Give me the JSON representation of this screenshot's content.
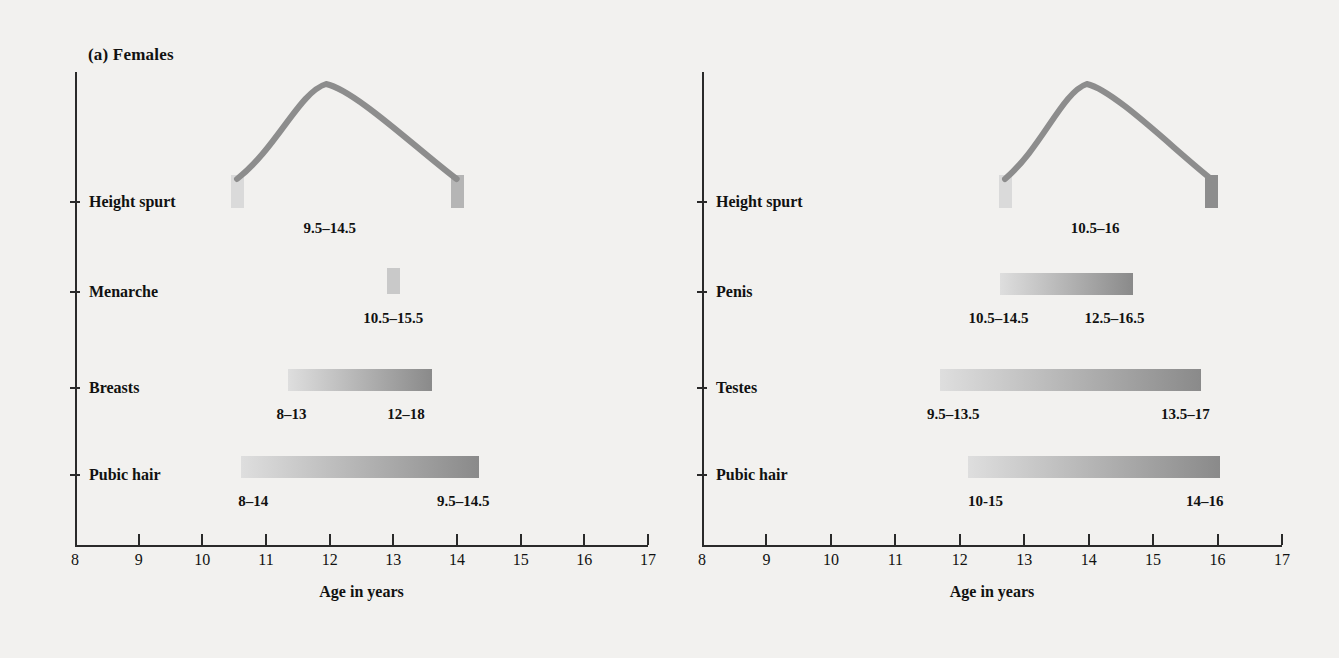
{
  "figure": {
    "background_color": "#f2f1ef",
    "axis_color": "#2a2a2a",
    "bar_light": "#dedede",
    "bar_dark": "#8a8a8a",
    "curve_color": "#8d8d8d"
  },
  "panels": [
    {
      "id": "females",
      "title": "(a) Females",
      "axis_caption": "Age in years",
      "x_ticks": [
        "8",
        "9",
        "10",
        "11",
        "12",
        "13",
        "14",
        "15",
        "16",
        "17"
      ],
      "rows": [
        {
          "label": "Height spurt",
          "type": "curve",
          "start": 10.55,
          "peak": 11.95,
          "end": 14.0,
          "labels": [
            {
              "text": "9.5–14.5",
              "at": 12.0
            }
          ]
        },
        {
          "label": "Menarche",
          "type": "block",
          "start": 12.9,
          "end": 13.1,
          "labels": [
            {
              "text": "10.5–15.5",
              "at": 13.0
            }
          ]
        },
        {
          "label": "Breasts",
          "type": "bar",
          "start": 11.35,
          "end": 13.6,
          "labels": [
            {
              "text": "8–13",
              "at": 11.4
            },
            {
              "text": "12–18",
              "at": 13.2
            }
          ]
        },
        {
          "label": "Pubic hair",
          "type": "bar",
          "start": 10.6,
          "end": 14.35,
          "labels": [
            {
              "text": "8–14",
              "at": 10.8
            },
            {
              "text": "9.5–14.5",
              "at": 14.1
            }
          ]
        }
      ]
    },
    {
      "id": "males",
      "title": "(b) Males",
      "axis_caption": "Age in years",
      "x_ticks": [
        "8",
        "9",
        "10",
        "11",
        "12",
        "13",
        "14",
        "15",
        "16",
        "17"
      ],
      "rows": [
        {
          "label": "Height spurt",
          "type": "curve",
          "start": 12.7,
          "peak": 13.97,
          "end": 15.9,
          "labels": [
            {
              "text": "10.5–16",
              "at": 14.1
            }
          ]
        },
        {
          "label": "Penis",
          "type": "bar",
          "start": 12.63,
          "end": 14.69,
          "labels": [
            {
              "text": "10.5–14.5",
              "at": 12.6
            },
            {
              "text": "12.5–16.5",
              "at": 14.4
            }
          ]
        },
        {
          "label": "Testes",
          "type": "bar",
          "start": 11.7,
          "end": 15.74,
          "labels": [
            {
              "text": "9.5–13.5",
              "at": 11.9
            },
            {
              "text": "13.5–17",
              "at": 15.5
            }
          ]
        },
        {
          "label": "Pubic hair",
          "type": "bar",
          "start": 12.13,
          "end": 16.04,
          "labels": [
            {
              "text": "10-15",
              "at": 12.4
            },
            {
              "text": "14–16",
              "at": 15.8
            }
          ]
        }
      ]
    }
  ],
  "chart_data": {
    "type": "bar",
    "xlabel": "Age in years",
    "ylabel": "",
    "xlim": [
      8,
      17
    ],
    "grid": false,
    "legend": "none",
    "panels": [
      {
        "name": "(a) Females",
        "categories": [
          "Height spurt",
          "Menarche",
          "Breasts",
          "Pubic hair"
        ],
        "ranges": [
          {
            "event": "Height spurt",
            "bar_start_age": 10.5,
            "bar_end_age": 14.0,
            "peak_age": 12.0,
            "annotation": "9.5–14.5"
          },
          {
            "event": "Menarche",
            "bar_start_age": 12.9,
            "bar_end_age": 13.1,
            "annotation": "10.5–15.5"
          },
          {
            "event": "Breasts",
            "bar_start_age": 11.35,
            "bar_end_age": 13.6,
            "onset_annotation": "8–13",
            "completion_annotation": "12–18"
          },
          {
            "event": "Pubic hair",
            "bar_start_age": 10.6,
            "bar_end_age": 14.35,
            "onset_annotation": "8–14",
            "completion_annotation": "9.5–14.5"
          }
        ]
      },
      {
        "name": "(b) Males",
        "categories": [
          "Height spurt",
          "Penis",
          "Testes",
          "Pubic hair"
        ],
        "ranges": [
          {
            "event": "Height spurt",
            "bar_start_age": 12.7,
            "bar_end_age": 15.9,
            "peak_age": 14.0,
            "annotation": "10.5–16"
          },
          {
            "event": "Penis",
            "bar_start_age": 12.6,
            "bar_end_age": 14.7,
            "onset_annotation": "10.5–14.5",
            "completion_annotation": "12.5–16.5"
          },
          {
            "event": "Testes",
            "bar_start_age": 11.7,
            "bar_end_age": 15.75,
            "onset_annotation": "9.5–13.5",
            "completion_annotation": "13.5–17"
          },
          {
            "event": "Pubic hair",
            "bar_start_age": 12.15,
            "bar_end_age": 16.0,
            "onset_annotation": "10-15",
            "completion_annotation": "14–16"
          }
        ]
      }
    ]
  }
}
